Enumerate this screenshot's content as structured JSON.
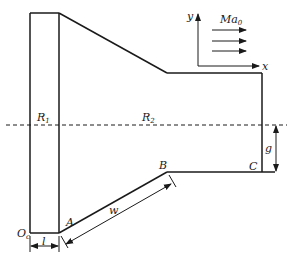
{
  "diagram": {
    "type": "axisymmetric nozzle / inlet geometry schematic",
    "labels": {
      "R1": "R",
      "R1_sub": "1",
      "R2": "R",
      "R2_sub": "2",
      "A": "A",
      "B": "B",
      "C": "C",
      "w": "w",
      "g": "g",
      "l": "l",
      "Oc": "O",
      "Oc_sub": "c",
      "y": "y",
      "x": "x",
      "Ma0": "Ma",
      "Ma0_sub": "0"
    },
    "colors": {
      "line": "#1a1a1a",
      "background": "#ffffff"
    },
    "flow_arrows": 3
  }
}
